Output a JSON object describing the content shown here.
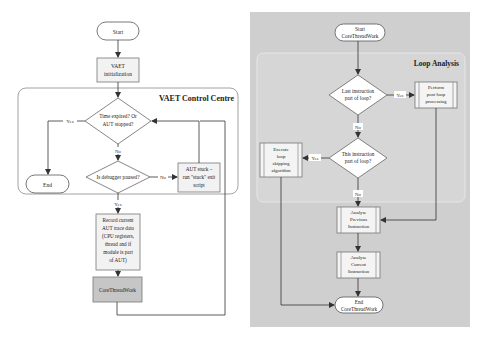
{
  "left_flowchart": {
    "container_title": "VAET Control Centre",
    "nodes": {
      "start": "Start",
      "init": [
        "VAET",
        "initialization"
      ],
      "decision_time": [
        "Time expired? Or",
        "AUT stopped?"
      ],
      "end": "End",
      "decision_debugger": "Is debugger paused?",
      "aut_stuck": [
        "AUT stuck –",
        "run \"stuck\" exit",
        "script"
      ],
      "record": [
        "Record current",
        "AUT trace data",
        "(CPU registers,",
        "thread and if",
        "module is part",
        "of AUT)"
      ],
      "corethreadwork": "CoreThreadWork"
    },
    "edge_labels": {
      "time_yes": "Yes",
      "time_no": "No",
      "debugger_no": "No",
      "debugger_yes": "Yes"
    }
  },
  "right_flowchart": {
    "container_title": "Loop Analysis",
    "nodes": {
      "start": [
        "Start",
        "CoreThreadWork"
      ],
      "decision_last": [
        "Last instruction",
        "part of loop?"
      ],
      "post_loop": [
        "Perform",
        "post-loop",
        "processing"
      ],
      "decision_this": [
        "This instruction",
        "part of loop?"
      ],
      "loop_skip": [
        "Execute",
        "loop",
        "skipping",
        "algorithm"
      ],
      "analyse_prev": [
        "Analyse",
        "Previous",
        "Instruction"
      ],
      "analyse_curr": [
        "Analyse",
        "Current",
        "Instruction"
      ],
      "end": [
        "End",
        "CoreThreadWork"
      ]
    },
    "edge_labels": {
      "last_yes": "Yes",
      "last_no": "No",
      "this_yes": "Yes",
      "this_no": "No"
    }
  },
  "colors": {
    "line": "#333333",
    "box_fill": "#f4f4f4",
    "highlight_fill": "#c8c8c8",
    "panel_bg": "#cfcfcf",
    "container_border": "#888888",
    "white_fill": "#ffffff"
  }
}
